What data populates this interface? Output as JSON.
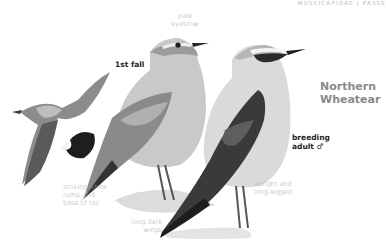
{
  "header": {
    "family": "MUSCICAPIDAE | PASSE"
  },
  "species": {
    "name_line1": "Northern",
    "name_line2": "Wheatear"
  },
  "labels": {
    "first_fall": "1st fall",
    "breeding_line1": "breeding",
    "breeding_line2": "adult ♂"
  },
  "annotations": {
    "eyebrow_line1": "pale",
    "eyebrow_line2": "eyebrow",
    "rump_line1": "striking white",
    "rump_line2": "rump and",
    "rump_line3": "base of tail",
    "wings_line1": "long dark",
    "wings_line2": "wings",
    "legs_line1": "upright and",
    "legs_line2": "long-legged"
  },
  "colors": {
    "background": "#ffffff",
    "plumage_light": "#d9d9d9",
    "plumage_mid": "#a8a8a8",
    "plumage_dark": "#3a3a3a"
  }
}
